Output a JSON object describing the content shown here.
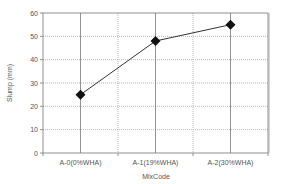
{
  "chart_data": {
    "type": "line",
    "title": "",
    "xlabel": "MixCode",
    "ylabel": "Slump (mm)",
    "categories": [
      "A-0(0%WHA)",
      "A-1(19%WHA)",
      "A-2(30%WHA)"
    ],
    "series": [
      {
        "name": "Slump",
        "values": [
          25,
          48,
          55
        ],
        "color": "#333333",
        "marker": "diamond"
      }
    ],
    "ylim": [
      0,
      60
    ],
    "yticks": [
      "0",
      "10",
      "20",
      "30",
      "40",
      "50",
      "60"
    ],
    "grid": true,
    "legend": "none"
  }
}
